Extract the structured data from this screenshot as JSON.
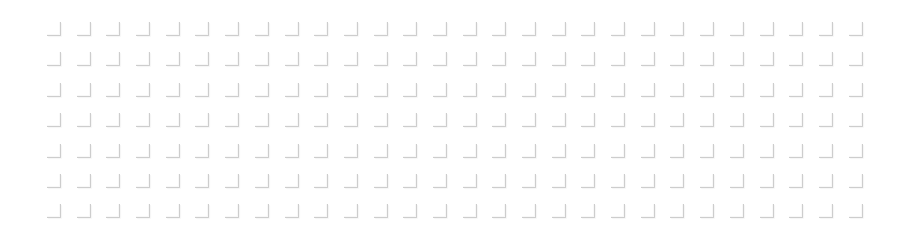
{
  "pattern": {
    "type": "corner-mark-grid",
    "rows": 7,
    "columns": 28,
    "mark_shape": "bottom-right-corner",
    "mark_color": "#cdcdcd",
    "background_color": "#ffffff"
  }
}
